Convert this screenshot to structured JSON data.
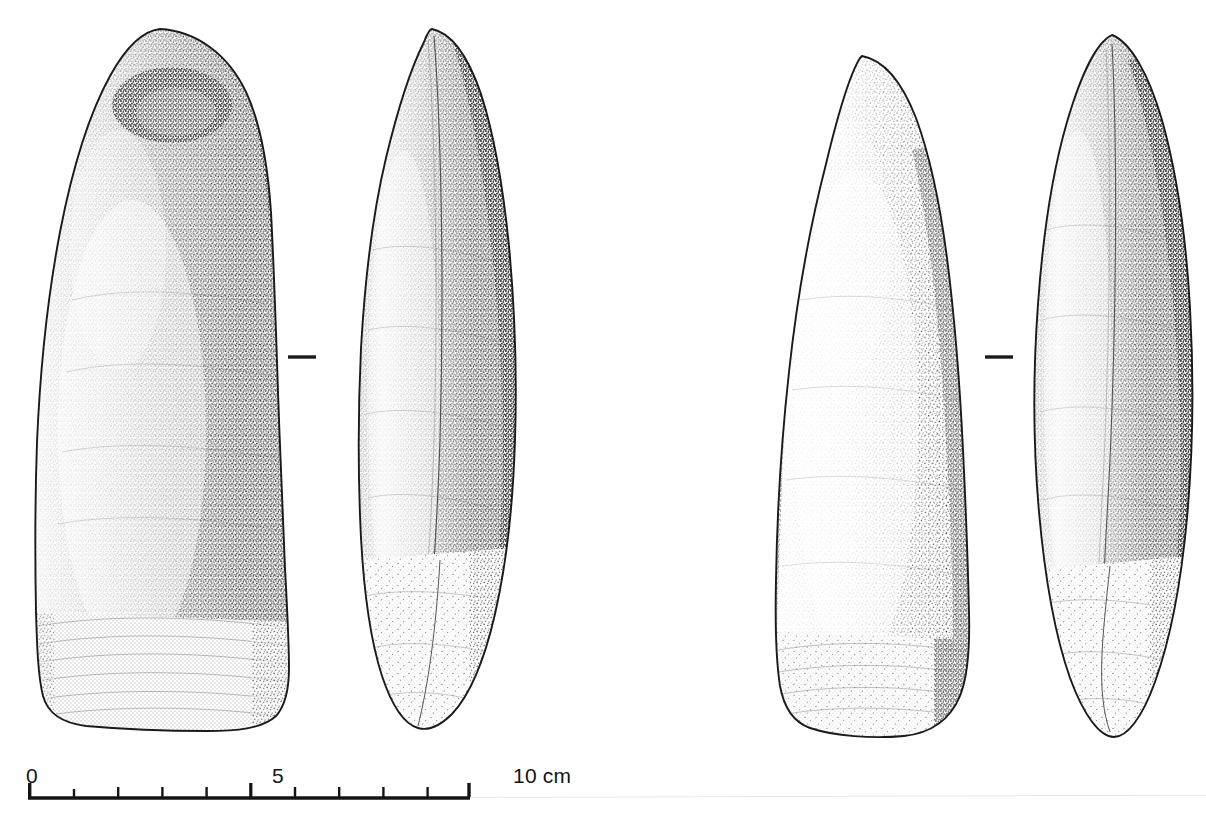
{
  "plate": {
    "kind": "archaeological-line-drawing",
    "subject": "two polished stone axe heads, each shown in frontal and profile view",
    "background_color": "#ffffff",
    "ink_color": "#1a1a1a",
    "width": 1206,
    "height": 831
  },
  "scale_bar": {
    "unit": "cm",
    "min_value": 0,
    "max_value": 10,
    "tick_interval": 1,
    "major_tick_interval": 5,
    "labels": [
      {
        "text": "0",
        "value": 0
      },
      {
        "text": "5",
        "value": 5
      },
      {
        "text": "10 cm",
        "value": 10
      }
    ],
    "bar_start_x": 28,
    "bar_end_x": 470,
    "baseline_y": 798,
    "px_per_cm": 44.2,
    "line_color": "#141414"
  },
  "objects": [
    {
      "id": "object-1",
      "label": "polished stone axe 1",
      "views": [
        {
          "id": "object-1-face",
          "view_name": "face-view",
          "bounds": {
            "x": 30,
            "y": 28,
            "width": 262,
            "height": 702
          },
          "description": "elongated axe with rounded butt, near-parallel sides widening to a convex cutting edge; dense stipple shading, polished blade band at base"
        },
        {
          "id": "object-1-profile",
          "view_name": "profile-view",
          "bounds": {
            "x": 358,
            "y": 28,
            "width": 162,
            "height": 702
          },
          "description": "narrow lenticular profile, thickest at mid-body, tapering to a thin cutting edge"
        }
      ],
      "separator_mark": {
        "id": "object-1-separator",
        "shape": "short-horizontal-dash",
        "x": 288,
        "y": 357,
        "length": 28
      }
    },
    {
      "id": "object-2",
      "label": "polished stone axe 2",
      "views": [
        {
          "id": "object-2-face",
          "view_name": "face-view",
          "bounds": {
            "x": 775,
            "y": 55,
            "width": 196,
            "height": 682
          },
          "description": "axe with pointed, tapering butt and straight flaring sides to a broad convex cutting edge; stipple shading heaviest along right margin"
        },
        {
          "id": "object-2-profile",
          "view_name": "profile-view",
          "bounds": {
            "x": 1034,
            "y": 34,
            "width": 158,
            "height": 703
          },
          "description": "slender pointed-oval profile, symmetric lens section narrowing at both ends"
        }
      ],
      "separator_mark": {
        "id": "object-2-separator",
        "shape": "short-horizontal-dash",
        "x": 985,
        "y": 357,
        "length": 28
      }
    }
  ],
  "scan_artifact": {
    "present": true,
    "description": "faint pale grey horizontal scan line across the lower right of the page",
    "color": "#e9e9ea"
  }
}
